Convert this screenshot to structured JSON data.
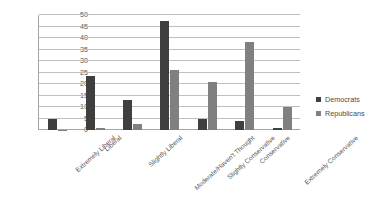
{
  "chart_data": {
    "type": "bar",
    "title": "",
    "xlabel": "",
    "ylabel": "",
    "ylim": [
      0,
      50
    ],
    "yticks": [
      0,
      5,
      10,
      15,
      20,
      25,
      30,
      35,
      40,
      45,
      50
    ],
    "grid": true,
    "legend_position": "right",
    "categories": [
      "Extremely Liberal",
      "Liberal",
      "Slightly Liberal",
      "Moderate/Haven't Thought",
      "Slightly Conservative",
      "Conservative",
      "Extremely Conservative"
    ],
    "series": [
      {
        "name": "Democrats",
        "color": "#3f3f3f",
        "values": [
          4.9,
          23.4,
          13.2,
          47.2,
          4.8,
          3.9,
          0.8
        ]
      },
      {
        "name": "Republicans",
        "color": "#808080",
        "values": [
          0.2,
          0.8,
          2.5,
          26.2,
          20.7,
          38.2,
          9.8
        ]
      }
    ]
  },
  "legend": {
    "items": [
      {
        "label": "Democrats"
      },
      {
        "label": "Republicans"
      }
    ]
  }
}
